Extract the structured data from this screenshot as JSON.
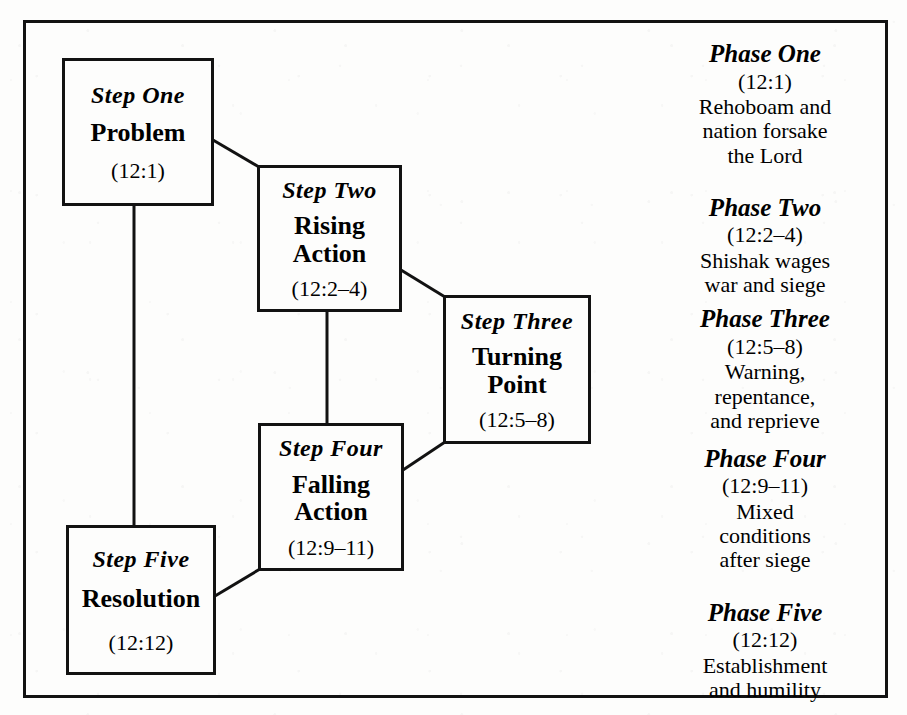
{
  "diagram": {
    "type": "narrative-structure-flow",
    "steps": [
      {
        "label": "Step One",
        "title": "Problem",
        "reference": "(12:1)"
      },
      {
        "label": "Step Two",
        "title": "Rising\nAction",
        "title_line1": "Rising",
        "title_line2": "Action",
        "reference": "(12:2–4)"
      },
      {
        "label": "Step Three",
        "title": "Turning\nPoint",
        "title_line1": "Turning",
        "title_line2": "Point",
        "reference": "(12:5–8)"
      },
      {
        "label": "Step Four",
        "title": "Falling\nAction",
        "title_line1": "Falling",
        "title_line2": "Action",
        "reference": "(12:9–11)"
      },
      {
        "label": "Step Five",
        "title": "Resolution",
        "reference": "(12:12)"
      }
    ],
    "phases": [
      {
        "name": "Phase One",
        "reference": "(12:1)",
        "description": "Rehoboam and\nnation forsake\nthe Lord"
      },
      {
        "name": "Phase Two",
        "reference": "(12:2–4)",
        "description": "Shishak wages\nwar and siege"
      },
      {
        "name": "Phase Three",
        "reference": "(12:5–8)",
        "description": "Warning,\nrepentance,\nand reprieve"
      },
      {
        "name": "Phase Four",
        "reference": "(12:9–11)",
        "description": "Mixed\nconditions\nafter siege"
      },
      {
        "name": "Phase Five",
        "reference": "(12:12)",
        "description": "Establishment\nand humility"
      }
    ],
    "colors": {
      "ink": "#121212",
      "paper": "#fdfdfc"
    }
  }
}
